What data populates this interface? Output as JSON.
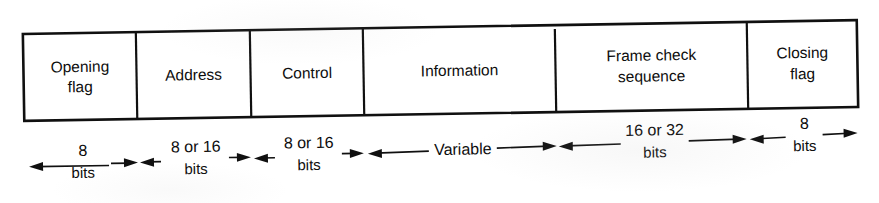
{
  "figure": {
    "type": "frame-format-diagram",
    "fields": [
      {
        "id": "opening-flag",
        "label_line1": "Opening",
        "label_line2": "flag",
        "size_value": "8",
        "size_unit": "bits"
      },
      {
        "id": "address",
        "label_line1": "Address",
        "label_line2": "",
        "size_value": "8 or 16",
        "size_unit": "bits"
      },
      {
        "id": "control",
        "label_line1": "Control",
        "label_line2": "",
        "size_value": "8 or 16",
        "size_unit": "bits"
      },
      {
        "id": "information",
        "label_line1": "Information",
        "label_line2": "",
        "size_value": "Variable",
        "size_unit": ""
      },
      {
        "id": "frame-check-sequence",
        "label_line1": "Frame check",
        "label_line2": "sequence",
        "size_value": "16 or 32",
        "size_unit": "bits"
      },
      {
        "id": "closing-flag",
        "label_line1": "Closing",
        "label_line2": "flag",
        "size_value": "8",
        "size_unit": "bits"
      }
    ],
    "colors": {
      "ink": "#101010",
      "paper": "#ffffff"
    }
  }
}
